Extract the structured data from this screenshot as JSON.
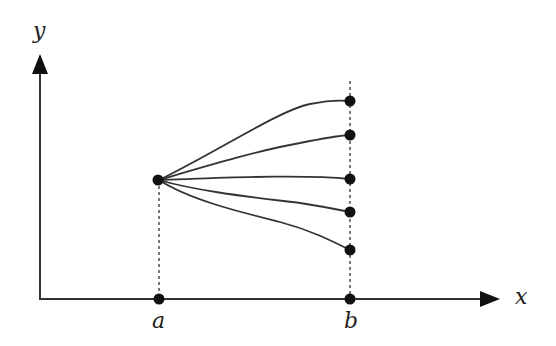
{
  "diagram": {
    "type": "function family diagram",
    "axes": {
      "x_label": "x",
      "y_label": "y"
    },
    "points": {
      "a_label": "a",
      "b_label": "b"
    },
    "colors": {
      "stroke": "#333333",
      "dot": "#111111",
      "background": "#ffffff"
    },
    "curves": [
      {
        "name": "curve-1",
        "start": "(a, y0)",
        "end": "b-top"
      },
      {
        "name": "curve-2",
        "start": "(a, y0)",
        "end": "b-upper"
      },
      {
        "name": "curve-3",
        "start": "(a, y0)",
        "end": "b-middle"
      },
      {
        "name": "curve-4",
        "start": "(a, y0)",
        "end": "b-lower"
      },
      {
        "name": "curve-5",
        "start": "(a, y0)",
        "end": "b-bottom"
      }
    ]
  }
}
